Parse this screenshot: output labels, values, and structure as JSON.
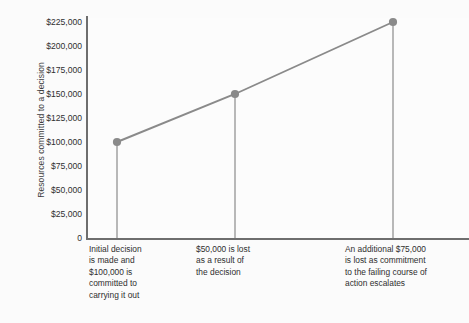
{
  "chart_data": {
    "type": "line",
    "title": "",
    "subtitle": "",
    "xlabel": "",
    "ylabel": "Resources committed to a decision",
    "ylim": [
      0,
      225000
    ],
    "grid": false,
    "legend": "none",
    "x": [
      1,
      2,
      3
    ],
    "values": [
      100000,
      150000,
      225000
    ],
    "series": [
      {
        "name": "Resources committed",
        "values": [
          100000,
          150000,
          225000
        ]
      }
    ],
    "point_labels": [
      "$100,000",
      "$150,000",
      "$225,000"
    ],
    "ytick_labels": [
      "0",
      "$25,000",
      "$50,000",
      "$75,000",
      "$100,000",
      "$125,000",
      "$150,000",
      "$175,000",
      "$200,000",
      "$225,000"
    ],
    "ytick_values": [
      0,
      25000,
      50000,
      75000,
      100000,
      125000,
      150000,
      175000,
      200000,
      225000
    ],
    "annotations": [
      "Initial decision\nis made and\n$100,000 is\ncommitted to\ncarrying it out",
      "$50,000 is lost\nas a result of\nthe decision",
      "An additional $75,000\nis lost as commitment\nto the failing course of\naction escalates"
    ],
    "colors": {
      "line": "#8a8a8a",
      "marker": "#8a8a8a",
      "droplines": "#8a8a8a",
      "axis": "#6e6e6e",
      "text": "#2f2f2f",
      "background": "#fbfbfb"
    }
  }
}
